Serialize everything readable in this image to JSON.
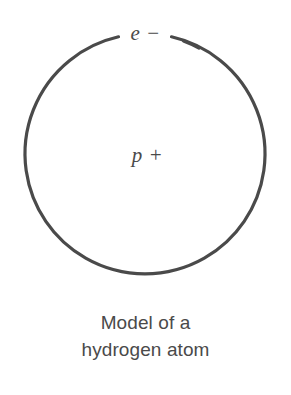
{
  "figure": {
    "kind": "science-diagram",
    "background_color": "#ffffff",
    "ink_color": "#4a4a4a",
    "diagram": {
      "orbit": {
        "name": "electron-orbit-circle",
        "shape": "circle",
        "center_x": 145,
        "center_y": 160,
        "radius": 120,
        "stroke_color": "#4a4a4a",
        "stroke_width": 3,
        "gap_at_top_degrees": 30,
        "fill": "none"
      },
      "labels": {
        "electron": "e −",
        "proton": "p +"
      }
    },
    "caption": {
      "lines": [
        "Model of a",
        "hydrogen atom"
      ],
      "line1": "Model of a",
      "line2": "hydrogen atom",
      "color": "#4a4a4a",
      "align": "center"
    }
  }
}
